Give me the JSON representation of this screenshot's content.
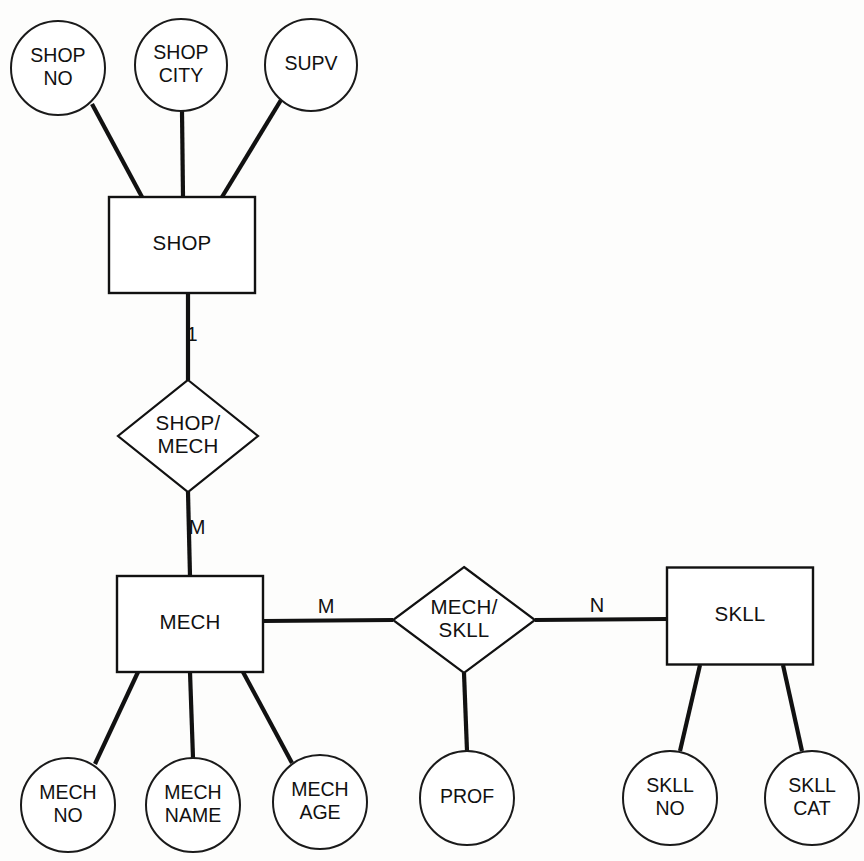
{
  "diagram": {
    "type": "entity-relationship-diagram",
    "notation": "Chen",
    "background_color": "#fdfdfc",
    "line_color": "#111111",
    "fill_color": "#ffffff"
  },
  "entities": [
    {
      "id": "shop",
      "label": "SHOP",
      "x": 182,
      "y": 245,
      "width": 146,
      "height": 96
    },
    {
      "id": "mech",
      "label": "MECH",
      "x": 190,
      "y": 624,
      "width": 146,
      "height": 96
    },
    {
      "id": "skll",
      "label": "SKLL",
      "x": 740,
      "y": 616,
      "width": 146,
      "height": 97
    }
  ],
  "relationships": [
    {
      "id": "shop_mech",
      "line1": "SHOP/",
      "line2": "MECH",
      "x": 188,
      "y": 436,
      "rx": 70,
      "ry": 56
    },
    {
      "id": "mech_skll",
      "line1": "MECH/",
      "line2": "SKLL",
      "x": 464,
      "y": 620,
      "rx": 71,
      "ry": 53
    }
  ],
  "attributes": [
    {
      "id": "shop_no",
      "line1": "SHOP",
      "line2": "NO",
      "x": 58,
      "y": 68,
      "r": 47
    },
    {
      "id": "shop_city",
      "line1": "SHOP",
      "line2": "CITY",
      "x": 181,
      "y": 65,
      "r": 46
    },
    {
      "id": "supv",
      "line1": "SUPV",
      "line2": "",
      "x": 311,
      "y": 65,
      "r": 46
    },
    {
      "id": "mech_no",
      "line1": "MECH",
      "line2": "NO",
      "x": 68,
      "y": 805,
      "r": 47
    },
    {
      "id": "mech_name",
      "line1": "MECH",
      "line2": "NAME",
      "x": 193,
      "y": 805,
      "r": 47
    },
    {
      "id": "mech_age",
      "line1": "MECH",
      "line2": "AGE",
      "x": 320,
      "y": 802,
      "r": 47
    },
    {
      "id": "prof",
      "line1": "PROF",
      "line2": "",
      "x": 467,
      "y": 798,
      "r": 47
    },
    {
      "id": "skll_no",
      "line1": "SKLL",
      "line2": "NO",
      "x": 670,
      "y": 798,
      "r": 47
    },
    {
      "id": "skll_cat",
      "line1": "SKLL",
      "line2": "CAT",
      "x": 812,
      "y": 798,
      "r": 47
    }
  ],
  "edges": [
    {
      "id": "e-shopno-shop",
      "from": "shop_no",
      "to": "shop",
      "x1": 92,
      "y1": 104,
      "x2": 142,
      "y2": 197
    },
    {
      "id": "e-shopcity-shop",
      "from": "shop_city",
      "to": "shop",
      "x1": 182,
      "y1": 111,
      "x2": 183,
      "y2": 197
    },
    {
      "id": "e-supv-shop",
      "from": "supv",
      "to": "shop",
      "x1": 281,
      "y1": 100,
      "x2": 222,
      "y2": 197
    },
    {
      "id": "e-shop-rel",
      "from": "shop",
      "to": "shop_mech",
      "x1": 188,
      "y1": 293,
      "x2": 188,
      "y2": 380
    },
    {
      "id": "e-rel-mech",
      "from": "shop_mech",
      "to": "mech",
      "x1": 188,
      "y1": 492,
      "x2": 190,
      "y2": 576
    },
    {
      "id": "e-mech-relskll",
      "from": "mech",
      "to": "mech_skll",
      "x1": 263,
      "y1": 621,
      "x2": 393,
      "y2": 620
    },
    {
      "id": "e-relskll-skll",
      "from": "mech_skll",
      "to": "skll",
      "x1": 535,
      "y1": 620,
      "x2": 667,
      "y2": 619
    },
    {
      "id": "e-mech-mechno",
      "from": "mech",
      "to": "mech_no",
      "x1": 138,
      "y1": 672,
      "x2": 95,
      "y2": 764
    },
    {
      "id": "e-mech-mechname",
      "from": "mech",
      "to": "mech_name",
      "x1": 190,
      "y1": 672,
      "x2": 193,
      "y2": 758
    },
    {
      "id": "e-mech-mechage",
      "from": "mech",
      "to": "mech_age",
      "x1": 243,
      "y1": 672,
      "x2": 292,
      "y2": 763
    },
    {
      "id": "e-relskll-prof",
      "from": "mech_skll",
      "to": "prof",
      "x1": 464,
      "y1": 673,
      "x2": 467,
      "y2": 751
    },
    {
      "id": "e-skll-skllno",
      "from": "skll",
      "to": "skll_no",
      "x1": 700,
      "y1": 665,
      "x2": 680,
      "y2": 751
    },
    {
      "id": "e-skll-skllcat",
      "from": "skll",
      "to": "skll_cat",
      "x1": 783,
      "y1": 665,
      "x2": 802,
      "y2": 751
    }
  ],
  "cardinalities": [
    {
      "id": "card-shop-1",
      "label": "1",
      "x": 192,
      "y": 336
    },
    {
      "id": "card-mech-m",
      "label": "M",
      "x": 197,
      "y": 529
    },
    {
      "id": "card-mech-skll-m",
      "label": "M",
      "x": 326,
      "y": 608
    },
    {
      "id": "card-skll-n",
      "label": "N",
      "x": 597,
      "y": 607
    }
  ]
}
